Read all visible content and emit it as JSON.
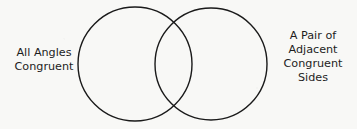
{
  "diagram": {
    "type": "venn-diagram",
    "set_count": 2,
    "background_color": "#f8f8f6",
    "stroke_color": "#1a1a1a",
    "stroke_width": 1.4,
    "circles": [
      {
        "name": "left-circle",
        "cx": 135,
        "cy": 64,
        "r": 57
      },
      {
        "name": "right-circle",
        "cx": 211,
        "cy": 64,
        "r": 56
      }
    ],
    "left_label": {
      "lines": [
        "All Angles",
        "Congruent"
      ]
    },
    "right_label": {
      "lines": [
        "A Pair of",
        "Adjacent",
        "Congruent",
        "Sides"
      ]
    }
  }
}
